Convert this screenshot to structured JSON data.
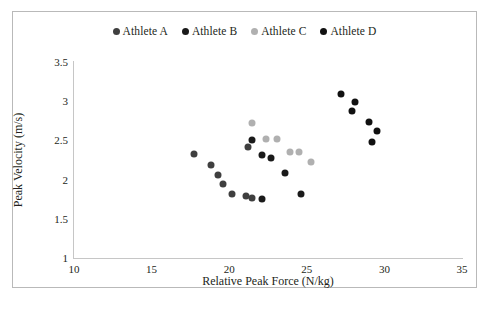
{
  "chart_data": {
    "type": "scatter",
    "title": "",
    "xlabel": "Relative Peak Force (N/kg)",
    "ylabel": "Peak Velocity (m/s)",
    "xlim": [
      10,
      35
    ],
    "ylim": [
      1,
      3.5
    ],
    "xticks": [
      10,
      15,
      20,
      25,
      30,
      35
    ],
    "yticks": [
      1,
      1.5,
      2,
      2.5,
      3,
      3.5
    ],
    "xtick_labels": [
      "10",
      "15",
      "20",
      "25",
      "30",
      "35"
    ],
    "ytick_labels": [
      "1",
      "1.5",
      "2",
      "2.5",
      "3",
      "3.5"
    ],
    "grid": false,
    "legend_position": "top-center",
    "marker": "circle",
    "series": [
      {
        "name": "Athlete A",
        "color": "#3f3f3f",
        "points": [
          {
            "x": 17.7,
            "y": 2.33
          },
          {
            "x": 18.8,
            "y": 2.18
          },
          {
            "x": 19.3,
            "y": 2.06
          },
          {
            "x": 19.6,
            "y": 1.94
          },
          {
            "x": 20.2,
            "y": 1.81
          },
          {
            "x": 21.1,
            "y": 1.79
          },
          {
            "x": 21.2,
            "y": 2.42
          },
          {
            "x": 21.5,
            "y": 1.76
          }
        ]
      },
      {
        "name": "Athlete B",
        "color": "#1a1a1a",
        "points": [
          {
            "x": 21.5,
            "y": 2.5
          },
          {
            "x": 22.1,
            "y": 2.31
          },
          {
            "x": 22.7,
            "y": 2.27
          },
          {
            "x": 23.6,
            "y": 2.09
          },
          {
            "x": 22.1,
            "y": 1.75
          },
          {
            "x": 24.6,
            "y": 1.82
          }
        ]
      },
      {
        "name": "Athlete C",
        "color": "#b0b0b0",
        "points": [
          {
            "x": 21.5,
            "y": 2.72
          },
          {
            "x": 22.4,
            "y": 2.52
          },
          {
            "x": 23.1,
            "y": 2.52
          },
          {
            "x": 23.9,
            "y": 2.35
          },
          {
            "x": 24.5,
            "y": 2.35
          },
          {
            "x": 25.3,
            "y": 2.22
          }
        ]
      },
      {
        "name": "Athlete D",
        "color": "#111111",
        "points": [
          {
            "x": 27.2,
            "y": 3.09
          },
          {
            "x": 28.1,
            "y": 2.99
          },
          {
            "x": 27.9,
            "y": 2.88
          },
          {
            "x": 29.0,
            "y": 2.73
          },
          {
            "x": 29.5,
            "y": 2.62
          },
          {
            "x": 29.2,
            "y": 2.48
          }
        ]
      }
    ]
  }
}
